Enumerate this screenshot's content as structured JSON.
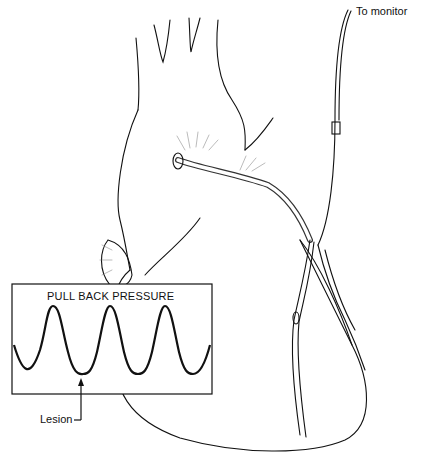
{
  "figure": {
    "type": "medical-illustration"
  },
  "labels": {
    "monitor": "To monitor",
    "inset_title": "PULL BACK PRESSURE",
    "lesion": "Lesion"
  },
  "inset": {
    "waveform": "sinusoidal pressure trace",
    "cycles": 4
  },
  "colors": {
    "line": "#111111",
    "background": "#ffffff"
  }
}
